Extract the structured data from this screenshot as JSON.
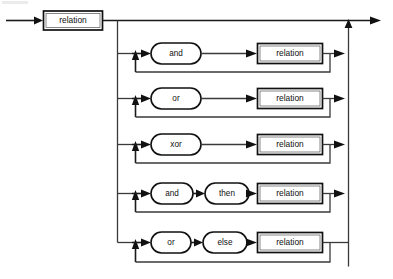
{
  "diagram": {
    "kind": "railroad-syntax-diagram",
    "entry_arrow": "entry-arrow",
    "exit_arrow": "exit-arrow",
    "colors": {
      "line": "#1a1a1a",
      "box_stroke": "#111111",
      "text": "#111111",
      "background": "#ffffff"
    },
    "head": {
      "label": "relation",
      "shape": "rect"
    },
    "alternatives": [
      {
        "id": "and",
        "tokens": [
          {
            "label": "and",
            "shape": "ellipse"
          }
        ],
        "target": {
          "label": "relation",
          "shape": "rect"
        },
        "loop": true
      },
      {
        "id": "or",
        "tokens": [
          {
            "label": "or",
            "shape": "ellipse"
          }
        ],
        "target": {
          "label": "relation",
          "shape": "rect"
        },
        "loop": true
      },
      {
        "id": "xor",
        "tokens": [
          {
            "label": "xor",
            "shape": "ellipse"
          }
        ],
        "target": {
          "label": "relation",
          "shape": "rect"
        },
        "loop": true
      },
      {
        "id": "and-then",
        "tokens": [
          {
            "label": "and",
            "shape": "ellipse"
          },
          {
            "label": "then",
            "shape": "ellipse"
          }
        ],
        "target": {
          "label": "relation",
          "shape": "rect"
        },
        "loop": true
      },
      {
        "id": "or-else",
        "tokens": [
          {
            "label": "or",
            "shape": "ellipse"
          },
          {
            "label": "else",
            "shape": "ellipse"
          }
        ],
        "target": {
          "label": "relation",
          "shape": "rect"
        },
        "loop": true
      }
    ]
  }
}
